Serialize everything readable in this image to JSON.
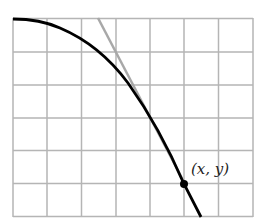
{
  "figure": {
    "point_label": "(x, y)",
    "grid": {
      "columns": 7,
      "rows": 6
    },
    "colors": {
      "grid": "#b5b5b5",
      "curve": "#000000",
      "tangent": "#a8a8a8",
      "point": "#000000"
    }
  }
}
